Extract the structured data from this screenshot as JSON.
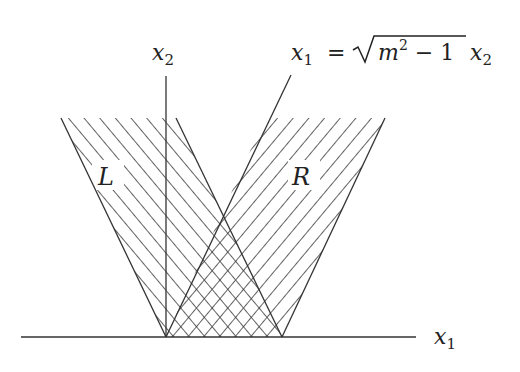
{
  "diagram": {
    "type": "region-hatch",
    "axes": {
      "horizontal": {
        "label": "x",
        "subscript": "1"
      },
      "vertical": {
        "label": "x",
        "subscript": "2"
      }
    },
    "boundary_line": {
      "label_lhs": "x",
      "label_lhs_sub": "1",
      "equals": "=",
      "radicand_var": "m",
      "radicand_exp": "2",
      "radicand_rest": " − 1",
      "label_rhs": "x",
      "label_rhs_sub": "2"
    },
    "regions": [
      {
        "id": "L",
        "label": "L",
        "hatch": "diagonal-up"
      },
      {
        "id": "R",
        "label": "R",
        "hatch": "diagonal-down"
      },
      {
        "id": "overlap",
        "label": "",
        "hatch": "cross"
      }
    ],
    "colors": {
      "line": "#333333",
      "background": "#ffffff"
    }
  }
}
